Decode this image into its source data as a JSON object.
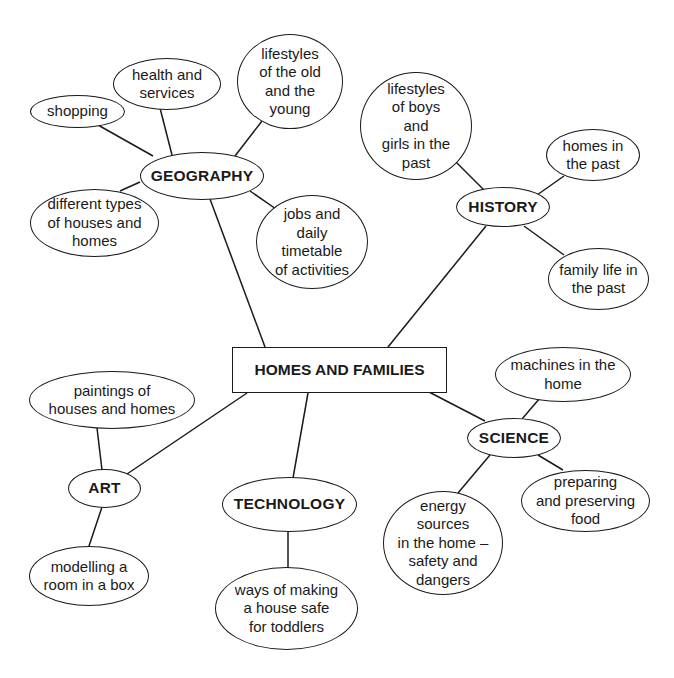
{
  "center": {
    "label": "HOMES AND FAMILIES"
  },
  "hubs": {
    "geography": {
      "label": "GEOGRAPHY"
    },
    "history": {
      "label": "HISTORY"
    },
    "science": {
      "label": "SCIENCE"
    },
    "technology": {
      "label": "TECHNOLOGY"
    },
    "art": {
      "label": "ART"
    }
  },
  "leaves": {
    "shopping": "shopping",
    "health": "health and\nservices",
    "lifestyles_old_young": "lifestyles\nof the old\nand the\nyoung",
    "house_types": "different types\nof houses and\nhomes",
    "jobs": "jobs and\ndaily\ntimetable\nof activities",
    "lifestyles_past": "lifestyles\nof boys\nand\ngirls in the\npast",
    "homes_past": "homes in\nthe past",
    "family_life_past": "family life in\nthe past",
    "machines": "machines in the\nhome",
    "preparing_food": "preparing\nand preserving\nfood",
    "energy": "energy\nsources\nin the home –\nsafety and\ndangers",
    "safe_toddlers": "ways of making\na house safe\nfor toddlers",
    "paintings": "paintings of\nhouses and homes",
    "modelling": "modelling a\nroom in a box"
  },
  "colors": {
    "stroke": "#1a1a1a",
    "background": "#ffffff"
  }
}
